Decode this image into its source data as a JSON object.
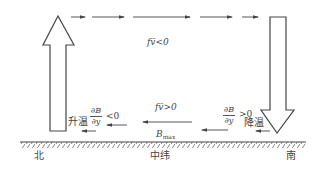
{
  "diagram": {
    "labels": {
      "top_flow": "fv̄<0",
      "bottom_flow": "fv̄>0",
      "b_max": "B",
      "b_max_sub": "max",
      "left_grad_num": "∂B",
      "left_grad_den": "∂y",
      "left_grad_rel": "<0",
      "left_effect": "升温",
      "right_grad_num": "∂B",
      "right_grad_den": "∂y",
      "right_grad_rel": ">0",
      "right_effect": "降温",
      "north": "北",
      "mid_latitude": "中纬",
      "south": "南"
    },
    "elements": {
      "left_vertical_arrow": "upward (north, ascending)",
      "right_vertical_arrow": "downward (south, descending)",
      "top_flow_direction": "north-to-south (rightward)",
      "bottom_flow_direction": "south-to-north (leftward)",
      "ground": "hatched surface line"
    },
    "colors": {
      "stroke": "#555555",
      "text": "#444444"
    }
  }
}
